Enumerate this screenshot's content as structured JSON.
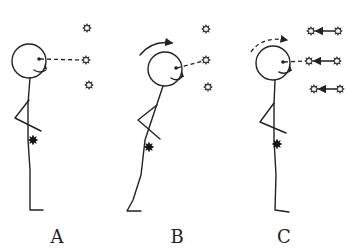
{
  "diagram": {
    "panels": [
      {
        "label": "A",
        "label_x": 57,
        "label_y": 226,
        "head": {
          "cx": 29,
          "cy": 61,
          "r": 17
        },
        "eye": {
          "x": 39,
          "y": 59
        },
        "mouth": "M34,70 Q40,74 46,70",
        "nose": {
          "x": 46,
          "y": 66
        },
        "gaze_line": {
          "x1": 40,
          "y1": 59,
          "x2": 83,
          "y2": 60
        },
        "body": "M30,78 L28,103 L28,140 L30,170 L30,210 L43,210",
        "arm": "M29,100 L15,118 L41,131",
        "marker_dark_star": {
          "x": 33,
          "y": 140
        },
        "stars": [
          {
            "x": 87,
            "y": 28
          },
          {
            "x": 86,
            "y": 60
          },
          {
            "x": 89,
            "y": 85
          }
        ],
        "rotation_arrow": null,
        "motion_arrows": []
      },
      {
        "label": "B",
        "label_x": 177,
        "label_y": 226,
        "head": {
          "cx": 165,
          "cy": 69,
          "r": 17
        },
        "eye": {
          "x": 176,
          "y": 68
        },
        "mouth": "M171,78 Q177,82 182,77",
        "nose": {
          "x": 183,
          "y": 74
        },
        "gaze_line": {
          "x1": 177,
          "y1": 68,
          "x2": 203,
          "y2": 61
        },
        "body": "M163,86 L155,110 L145,140 L141,175 L133,200 L127,211 L141,211",
        "arm": "M157,105 L138,120 L160,139",
        "marker_dark_star": {
          "x": 149,
          "y": 147
        },
        "stars": [
          {
            "x": 206,
            "y": 29
          },
          {
            "x": 206,
            "y": 60
          },
          {
            "x": 208,
            "y": 87
          }
        ],
        "rotation_arrow": {
          "path": "M140,55 Q152,40 172,43",
          "style": "solid",
          "head": {
            "x": 176,
            "y": 43
          }
        },
        "motion_arrows": []
      },
      {
        "label": "C",
        "label_x": 284,
        "label_y": 226,
        "head": {
          "cx": 273,
          "cy": 63,
          "r": 17
        },
        "eye": {
          "x": 283,
          "y": 62
        },
        "mouth": "M279,72 Q285,75 290,71",
        "nose": {
          "x": 291,
          "y": 68
        },
        "gaze_line": {
          "x1": 284,
          "y1": 62,
          "x2": 305,
          "y2": 61
        },
        "body": "M275,80 L274,105 L274,140 L276,175 L275,210 L289,212",
        "arm": "M274,103 L260,122 L286,133",
        "marker_dark_star": {
          "x": 277,
          "y": 144
        },
        "stars": [
          {
            "x": 311,
            "y": 31
          },
          {
            "x": 309,
            "y": 61
          },
          {
            "x": 314,
            "y": 89
          }
        ],
        "rotation_arrow": {
          "path": "M251,52 Q262,36 287,40",
          "style": "dashed",
          "head": {
            "x": 292,
            "y": 42
          }
        },
        "motion_arrows": [
          {
            "from_x": 338,
            "to_x": 316,
            "y": 31,
            "origin_star": {
              "x": 338,
              "y": 31
            }
          },
          {
            "from_x": 337,
            "to_x": 314,
            "y": 61,
            "origin_star": {
              "x": 337,
              "y": 61
            }
          },
          {
            "from_x": 340,
            "to_x": 319,
            "y": 89,
            "origin_star": {
              "x": 340,
              "y": 89
            }
          }
        ]
      }
    ]
  },
  "labels": {
    "a": "A",
    "b": "B",
    "c": "C"
  }
}
